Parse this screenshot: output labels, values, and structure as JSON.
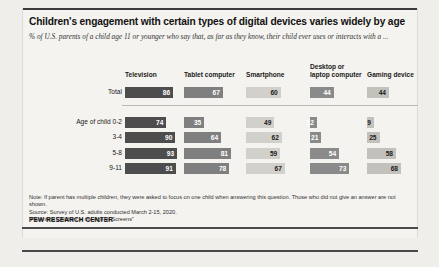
{
  "figure": {
    "title": "Children's engagement with certain types of digital devices varies widely by age",
    "subtitle": "% of U.S. parents of a child age 11 or younger who say that, as far as they know, their child ever uses or interacts with a ...",
    "note": "Note: If parent has multiple children, they were asked to focus on one child when answering this question. Those who did not give an answer are not shown.",
    "source": "Source: Survey of U.S. adults conducted March 2-15, 2020.",
    "study": "“Parenting Children in the Age of Screens”",
    "org": "PEW RESEARCH CENTER"
  },
  "chart_data": {
    "type": "bar",
    "title": "Children's engagement with certain types of digital devices varies widely by age",
    "subtitle": "% of U.S. parents of a child age 11 or younger who say that, as far as they know, their child ever uses or interacts with a ...",
    "xlabel": "",
    "ylabel": "",
    "xlim": [
      0,
      100
    ],
    "grid": false,
    "legend": "none",
    "orientation": "horizontal",
    "categories": [
      "Total",
      "Age of child 0-2",
      "3-4",
      "5-8",
      "9-11"
    ],
    "series": [
      {
        "name": "Television",
        "color": "#4d4d4d",
        "label_style": "dark",
        "values": [
          86,
          74,
          90,
          93,
          91
        ]
      },
      {
        "name": "Tablet computer",
        "color": "#7f7f7f",
        "label_style": "mid",
        "values": [
          67,
          35,
          64,
          81,
          78
        ]
      },
      {
        "name": "Smartphone",
        "color": "#d2d0cb",
        "label_style": "light",
        "values": [
          60,
          49,
          62,
          59,
          67
        ]
      },
      {
        "name": "Desktop or laptop computer",
        "color": "#8a8a8a",
        "label_style": "mid",
        "values": [
          44,
          12,
          21,
          54,
          73
        ]
      },
      {
        "name": "Gaming device",
        "color": "#c3c1bc",
        "label_style": "light",
        "values": [
          44,
          9,
          25,
          58,
          68
        ]
      }
    ]
  },
  "columns": [
    {
      "label": "Television",
      "line1": "Television",
      "line2": ""
    },
    {
      "label": "Tablet computer",
      "line1": "Tablet computer",
      "line2": ""
    },
    {
      "label": "Smartphone",
      "line1": "Smartphone",
      "line2": ""
    },
    {
      "label": "Desktop or laptop computer",
      "line1": "Desktop or",
      "line2": "laptop computer"
    },
    {
      "label": "Gaming device",
      "line1": "Gaming device",
      "line2": ""
    }
  ],
  "rows": [
    {
      "label": "Total",
      "group": "total"
    },
    {
      "label": "Age of child 0-2",
      "group": "age"
    },
    {
      "label": "3-4",
      "group": "age"
    },
    {
      "label": "5-8",
      "group": "age"
    },
    {
      "label": "9-11",
      "group": "age"
    }
  ]
}
